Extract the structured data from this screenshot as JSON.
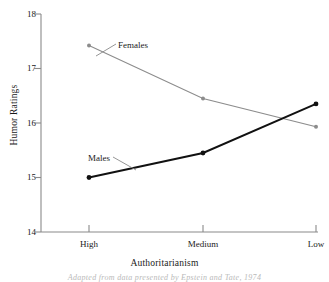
{
  "chart_data": {
    "type": "line",
    "title": "",
    "xlabel": "Authoritarianism",
    "ylabel": "Humor Ratings",
    "categories": [
      "High",
      "Medium",
      "Low"
    ],
    "series": [
      {
        "name": "Females",
        "values": [
          17.42,
          16.45,
          15.93
        ],
        "color": "#8c8c8c"
      },
      {
        "name": "Males",
        "values": [
          15.0,
          15.45,
          16.35
        ],
        "color": "#111111"
      }
    ],
    "ylim": [
      14,
      18
    ],
    "yticks": [
      14,
      15,
      16,
      17,
      18
    ],
    "ytick_labels": [
      "14",
      "15",
      "16",
      "17",
      "18"
    ],
    "xtick_labels": [
      "High",
      "Medium",
      "Low"
    ],
    "grid": false,
    "legend": "inline-annotations",
    "annotations": [
      {
        "text": "Females",
        "series": "Females"
      },
      {
        "text": "Males",
        "series": "Males"
      }
    ]
  },
  "axes": {
    "y_title": "Humor Ratings",
    "x_title": "Authoritarianism",
    "y_labels": {
      "t0": "14",
      "t1": "15",
      "t2": "16",
      "t3": "17",
      "t4": "18"
    },
    "x_labels": {
      "c0": "High",
      "c1": "Medium",
      "c2": "Low"
    }
  },
  "labels": {
    "females": "Females",
    "males": "Males"
  },
  "caption": {
    "text": "Adapted from data presented by Epstein and Tate, 1974"
  }
}
